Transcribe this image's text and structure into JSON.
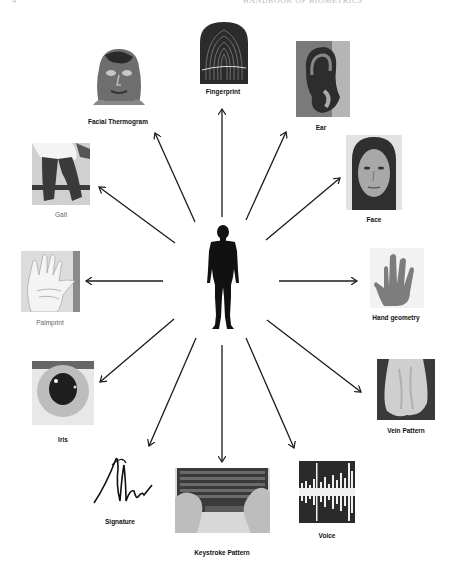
{
  "header": {
    "page_number": "4",
    "running_title": "HANDBOOK OF BIOMETRICS"
  },
  "center": {
    "figure": "human-silhouette"
  },
  "modalities": [
    {
      "id": "fingerprint",
      "label": "Fingerprint"
    },
    {
      "id": "ear",
      "label": "Ear"
    },
    {
      "id": "face",
      "label": "Face"
    },
    {
      "id": "hand-geometry",
      "label": "Hand geometry"
    },
    {
      "id": "vein-pattern",
      "label": "Vein Pattern"
    },
    {
      "id": "voice",
      "label": "Voice"
    },
    {
      "id": "keystroke-pattern",
      "label": "Keystroke Pattern"
    },
    {
      "id": "signature",
      "label": "Signature"
    },
    {
      "id": "iris",
      "label": "Iris"
    },
    {
      "id": "palmprint",
      "label": "Palmprint"
    },
    {
      "id": "gait",
      "label": "Gait"
    },
    {
      "id": "facial-thermogram",
      "label": "Facial Thermogram"
    }
  ],
  "colors": {
    "arrow": "#1a1a1a",
    "silhouette": "#111111",
    "background": "#ffffff"
  }
}
